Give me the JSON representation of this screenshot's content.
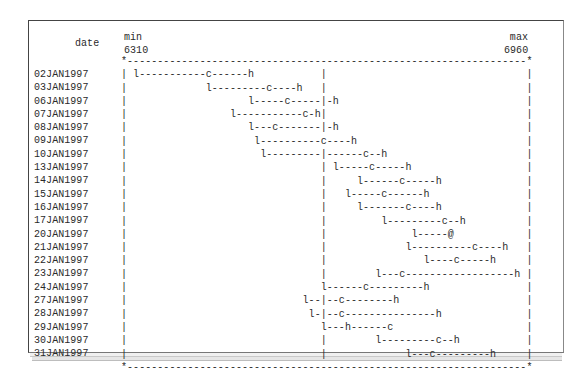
{
  "header": {
    "date_label": "date",
    "min_label": "min",
    "min_value": "6310",
    "max_label": "max",
    "max_value": "6960"
  },
  "plot_grid": {
    "width_cols": 68,
    "reference_col": 33,
    "symbols": {
      "low": "l",
      "close": "c",
      "high": "h",
      "coincide": "@",
      "border_corner": "*",
      "border": "-",
      "axis": "|"
    }
  },
  "rows": [
    {
      "date": "02JAN1997",
      "l": 2,
      "c": 14,
      "h": 21
    },
    {
      "date": "03JAN1997",
      "l": 14,
      "c": 24,
      "h": 29
    },
    {
      "date": "06JAN1997",
      "l": 21,
      "c": 27,
      "h": 35
    },
    {
      "date": "07JAN1997",
      "l": 18,
      "c": 30,
      "h": 32
    },
    {
      "date": "08JAN1997",
      "l": 21,
      "c": 25,
      "h": 35
    },
    {
      "date": "09JAN1997",
      "l": 22,
      "c": 33,
      "h": 38
    },
    {
      "date": "10JAN1997",
      "l": 23,
      "c": 40,
      "h": 43
    },
    {
      "date": "13JAN1997",
      "l": 35,
      "c": 41,
      "h": 47
    },
    {
      "date": "14JAN1997",
      "l": 39,
      "c": 46,
      "h": 52
    },
    {
      "date": "15JAN1997",
      "l": 37,
      "c": 43,
      "h": 50
    },
    {
      "date": "16JAN1997",
      "l": 39,
      "c": 47,
      "h": 52
    },
    {
      "date": "17JAN1997",
      "l": 43,
      "c": 53,
      "h": 56
    },
    {
      "date": "20JAN1997",
      "l": 48,
      "c": 54,
      "h": 54
    },
    {
      "date": "21JAN1997",
      "l": 47,
      "c": 58,
      "h": 63
    },
    {
      "date": "22JAN1997",
      "l": 50,
      "c": 55,
      "h": 61
    },
    {
      "date": "23JAN1997",
      "l": 42,
      "c": 46,
      "h": 65
    },
    {
      "date": "24JAN1997",
      "l": 33,
      "c": 40,
      "h": 50
    },
    {
      "date": "27JAN1997",
      "l": 30,
      "c": 36,
      "h": 45
    },
    {
      "date": "28JAN1997",
      "l": 31,
      "c": 36,
      "h": 52
    },
    {
      "date": "29JAN1997",
      "l": 33,
      "c": 44,
      "h": 37
    },
    {
      "date": "30JAN1997",
      "l": 42,
      "c": 52,
      "h": 55
    },
    {
      "date": "31JAN1997",
      "l": 47,
      "c": 51,
      "h": 61
    }
  ],
  "chart_data": {
    "type": "line",
    "subtype": "high-low-close (text plot)",
    "title": "",
    "xlabel": "",
    "ylabel": "date",
    "axis_min_label": "min",
    "axis_max_label": "max",
    "value_range": [
      6310,
      6960
    ],
    "reference_line_approx": 6630,
    "grid": false,
    "legend": {
      "l": "low",
      "c": "close",
      "h": "high",
      "@": "close equals high"
    },
    "categories": [
      "02JAN1997",
      "03JAN1997",
      "06JAN1997",
      "07JAN1997",
      "08JAN1997",
      "09JAN1997",
      "10JAN1997",
      "13JAN1997",
      "14JAN1997",
      "15JAN1997",
      "16JAN1997",
      "17JAN1997",
      "20JAN1997",
      "21JAN1997",
      "22JAN1997",
      "23JAN1997",
      "24JAN1997",
      "27JAN1997",
      "28JAN1997",
      "29JAN1997",
      "30JAN1997",
      "31JAN1997"
    ],
    "series": [
      {
        "name": "low",
        "values": [
          6330,
          6445,
          6515,
          6485,
          6515,
          6525,
          6535,
          6650,
          6690,
          6670,
          6690,
          6730,
          6775,
          6765,
          6795,
          6720,
          6630,
          6600,
          6610,
          6630,
          6720,
          6765
        ]
      },
      {
        "name": "close",
        "values": [
          6445,
          6545,
          6570,
          6600,
          6555,
          6630,
          6700,
          6710,
          6755,
          6730,
          6765,
          6825,
          6835,
          6875,
          6845,
          6755,
          6700,
          6660,
          6660,
          6735,
          6815,
          6805
        ]
      },
      {
        "name": "high",
        "values": [
          6515,
          6590,
          6650,
          6620,
          6650,
          6680,
          6730,
          6765,
          6815,
          6795,
          6815,
          6855,
          6835,
          6920,
          6900,
          6940,
          6795,
          6745,
          6815,
          6670,
          6845,
          6900
        ]
      }
    ]
  }
}
